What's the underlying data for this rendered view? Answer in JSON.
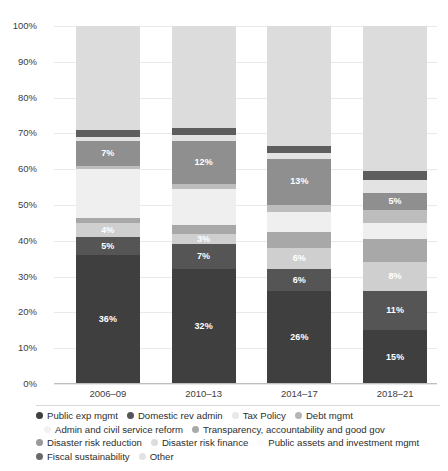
{
  "chart_data": {
    "type": "bar",
    "subtype": "stacked-percentage",
    "title": "",
    "xlabel": "",
    "ylabel": "",
    "ylim": [
      0,
      100
    ],
    "grid": true,
    "legend_position": "bottom",
    "categories": [
      "2006–09",
      "2010–13",
      "2014–17",
      "2018–21"
    ],
    "ytick_labels": [
      "0%",
      "10%",
      "20%",
      "30%",
      "40%",
      "50%",
      "60%",
      "70%",
      "80%",
      "90%",
      "100%"
    ],
    "ytick_values": [
      0,
      10,
      20,
      30,
      40,
      50,
      60,
      70,
      80,
      90,
      100
    ],
    "series": [
      {
        "name": "Public exp mgmt",
        "color": "#3f3f3f",
        "values": [
          36,
          32,
          26,
          15
        ],
        "labels": [
          "36%",
          "32%",
          "26%",
          "15%"
        ],
        "label_visible": [
          true,
          true,
          true,
          true
        ]
      },
      {
        "name": "Domestic rev admin",
        "color": "#555555",
        "values": [
          5,
          7,
          6,
          11
        ],
        "labels": [
          "5%",
          "7%",
          "6%",
          "11%"
        ],
        "label_visible": [
          true,
          true,
          true,
          true
        ]
      },
      {
        "name": "Tax Policy",
        "color": "#cfcfcf",
        "values": [
          4,
          3,
          6,
          8
        ],
        "labels": [
          "4%",
          "3%",
          "6%",
          "8%"
        ],
        "label_visible": [
          true,
          true,
          true,
          true
        ]
      },
      {
        "name": "Debt mgmt",
        "color": "#a8a8a8",
        "values": [
          1.5,
          2.5,
          4.5,
          6.5
        ],
        "labels": [
          "",
          "",
          "",
          ""
        ],
        "label_visible": [
          false,
          false,
          false,
          false
        ]
      },
      {
        "name": "Admin and civil service reform",
        "color": "#efefef",
        "values": [
          13.5,
          10,
          5.5,
          4.5
        ],
        "labels": [
          "",
          "",
          "",
          ""
        ],
        "label_visible": [
          false,
          false,
          false,
          false
        ]
      },
      {
        "name": "Transparency, accountability and good gov",
        "color": "#bdbdbd",
        "values": [
          1,
          1.5,
          2,
          3.5
        ],
        "labels": [
          "",
          "",
          "",
          ""
        ],
        "label_visible": [
          false,
          false,
          false,
          false
        ]
      },
      {
        "name": "Disaster risk reduction",
        "color": "#8f8f8f",
        "values": [
          7,
          12,
          13,
          5
        ],
        "labels": [
          "7%",
          "12%",
          "13%",
          "5%"
        ],
        "label_visible": [
          true,
          true,
          true,
          true
        ]
      },
      {
        "name": "Disaster risk finance",
        "color": "#e3e3e3",
        "values": [
          1,
          1.5,
          1.5,
          3.5
        ],
        "labels": [
          "",
          "",
          "",
          ""
        ],
        "label_visible": [
          false,
          false,
          false,
          false
        ]
      },
      {
        "name": "Public assets and investment mgmt",
        "color": "#5e5e5e",
        "values": [
          2,
          2,
          2,
          2.5
        ],
        "labels": [
          "",
          "",
          "",
          ""
        ],
        "label_visible": [
          false,
          false,
          false,
          false
        ]
      },
      {
        "name": "Fiscal sustainability",
        "color": "#6a6a6a",
        "values": [
          0,
          0,
          0,
          0
        ],
        "labels": [
          "",
          "",
          "",
          ""
        ],
        "label_visible": [
          false,
          false,
          false,
          false
        ]
      },
      {
        "name": "Other",
        "color": "#dcdcdc",
        "values": [
          29,
          28.5,
          33.5,
          40.5
        ],
        "labels": [
          "",
          "",
          "",
          ""
        ],
        "label_visible": [
          false,
          false,
          false,
          false
        ]
      }
    ]
  },
  "legend": {
    "rows": [
      [
        {
          "label": "Public exp mgmt",
          "color": "#3f3f3f"
        },
        {
          "label": "Domestic rev admin",
          "color": "#555555"
        },
        {
          "label": "Tax Policy",
          "color": "#e8e8e8"
        },
        {
          "label": "Debt mgmt",
          "color": "#b4b4b4"
        }
      ],
      [
        {
          "label": "Admin and civil service reform",
          "color": "#f2f2f2"
        },
        {
          "label": "Transparency, accountability and good gov",
          "color": "#a9a9a9"
        }
      ],
      [
        {
          "label": "Disaster risk reduction",
          "color": "#9a9a9a"
        },
        {
          "label": "Disaster risk finance",
          "color": "#dcdcdc"
        },
        {
          "label": "Public assets and investment mgmt",
          "color": "#fbfbfb"
        }
      ],
      [
        {
          "label": "Fiscal sustainability",
          "color": "#6a6a6a"
        },
        {
          "label": "Other",
          "color": "#e2e2e2"
        }
      ]
    ]
  }
}
